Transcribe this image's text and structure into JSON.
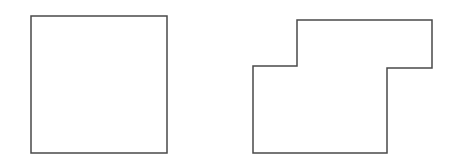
{
  "figure": {
    "canvas": {
      "width": 459,
      "height": 165,
      "background_color": "#ffffff"
    },
    "style": {
      "stroke_color": "#4a4a4a",
      "fill_color": "#ffffff",
      "stroke_width": 1.5
    },
    "shapes": [
      {
        "id": "left-square",
        "name": "square",
        "kind": "rectangle",
        "vertex_count": 4,
        "bounds": {
          "x": 31,
          "y": 16,
          "width": 136,
          "height": 137
        },
        "points": "31,16 167,16 167,153 31,153",
        "vertices": [
          {
            "x": 31,
            "y": 16
          },
          {
            "x": 167,
            "y": 16
          },
          {
            "x": 167,
            "y": 153
          },
          {
            "x": 31,
            "y": 153
          }
        ]
      },
      {
        "id": "right-stepped-polygon",
        "name": "stepped rectilinear polygon",
        "kind": "polygon",
        "vertex_count": 8,
        "bounds": {
          "x": 253,
          "y": 20,
          "width": 179,
          "height": 133
        },
        "points": "297,20 432,20 432,68 387,68 387,153 253,153 253,66 297,66",
        "vertices": [
          {
            "x": 297,
            "y": 20
          },
          {
            "x": 432,
            "y": 20
          },
          {
            "x": 432,
            "y": 68
          },
          {
            "x": 387,
            "y": 68
          },
          {
            "x": 387,
            "y": 153
          },
          {
            "x": 253,
            "y": 153
          },
          {
            "x": 253,
            "y": 66
          },
          {
            "x": 297,
            "y": 66
          }
        ]
      }
    ]
  }
}
